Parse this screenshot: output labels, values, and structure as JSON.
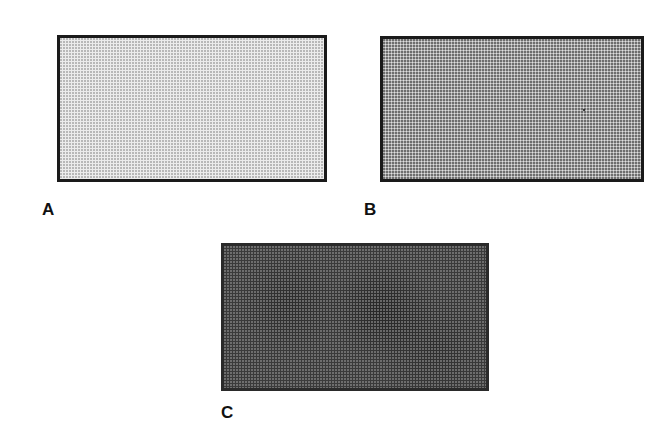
{
  "figure": {
    "panels": [
      {
        "id": "A",
        "label": "A",
        "shade": "light",
        "fill_color": "#e4e4e4"
      },
      {
        "id": "B",
        "label": "B",
        "shade": "medium",
        "fill_color": "#a8a8a8"
      },
      {
        "id": "C",
        "label": "C",
        "shade": "dark",
        "fill_color": "#3a3a3a"
      }
    ],
    "border_color": "#1a1a1a"
  }
}
